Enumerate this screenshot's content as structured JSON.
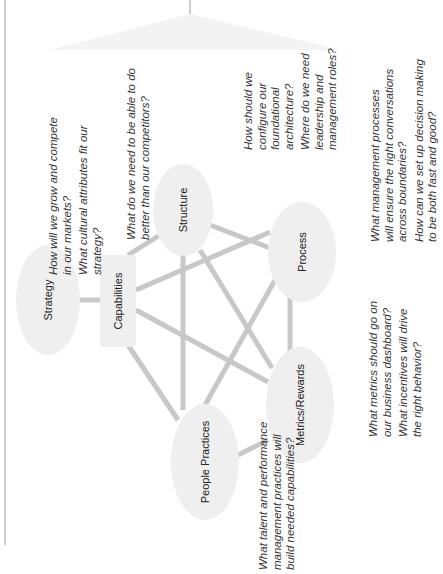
{
  "diagram": {
    "nodes": [
      {
        "id": "strategy",
        "label": "Strategy",
        "shape": "ellipse"
      },
      {
        "id": "capabilities",
        "label": "Capabilities",
        "shape": "rounded-rect"
      },
      {
        "id": "structure",
        "label": "Structure",
        "shape": "ellipse"
      },
      {
        "id": "process",
        "label": "Process",
        "shape": "ellipse"
      },
      {
        "id": "metrics",
        "label": "Metrics/Rewards",
        "shape": "ellipse"
      },
      {
        "id": "people",
        "label": "People Practices",
        "shape": "ellipse"
      }
    ],
    "edges": [
      [
        "strategy",
        "capabilities"
      ],
      [
        "capabilities",
        "structure"
      ],
      [
        "capabilities",
        "process"
      ],
      [
        "capabilities",
        "metrics"
      ],
      [
        "capabilities",
        "people"
      ],
      [
        "structure",
        "process"
      ],
      [
        "structure",
        "metrics"
      ],
      [
        "structure",
        "people"
      ],
      [
        "process",
        "metrics"
      ],
      [
        "process",
        "people"
      ],
      [
        "people",
        "metrics"
      ]
    ],
    "questions": {
      "strategy": [
        "How will we grow and compete\nin our markets?",
        "What cultural attributes fit our\nstrategy?"
      ],
      "capabilities": [
        "What do we need to be able to do\nbetter than our competitors?"
      ],
      "structure": [
        "How should we\nconfigure our\nfoundational\narchitecture?",
        "Where do we need\nleadership and\nmanagement roles?"
      ],
      "process": [
        "What management processes\nwill ensure the right conversations\nacross boundaries?",
        "How can we set up decision making\nto be both fast and good?"
      ],
      "metrics": [
        "What metrics should go on\nour business dashboard?",
        "What incentives will drive\nthe right behavior?"
      ],
      "people": [
        "What talent and performance\nmanagement practices will\nbuild needed capabilities?"
      ]
    },
    "colors": {
      "node_fill": "#efefef",
      "edge": "#c8c8c8",
      "triangle": "#f2f2f2",
      "frame_line": "#9a9a9a"
    }
  }
}
